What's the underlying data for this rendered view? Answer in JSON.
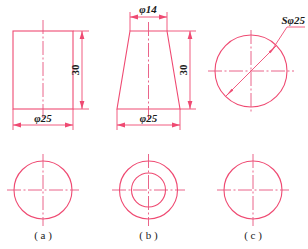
{
  "sheet": {
    "title": "Engineering drawing: three solids with front and top views",
    "background_color": "#ffffff",
    "line_color": "#ef4a72",
    "center_line_color": "#e8537d",
    "text_color": "#1b1b1b"
  },
  "panels": [
    {
      "id": "a",
      "caption": "( a )",
      "shape": "cylinder",
      "front_view": "rectangle",
      "top_view": "single-circle",
      "dimensions": [
        {
          "name": "height",
          "label": "30",
          "orientation": "vertical"
        },
        {
          "name": "diameter",
          "label": "φ25",
          "orientation": "horizontal"
        }
      ]
    },
    {
      "id": "b",
      "caption": "( b )",
      "shape": "truncated-cone",
      "front_view": "trapezoid",
      "top_view": "two-concentric-circles",
      "dimensions": [
        {
          "name": "top-diameter",
          "label": "φ14",
          "orientation": "horizontal"
        },
        {
          "name": "height",
          "label": "30",
          "orientation": "vertical"
        },
        {
          "name": "bottom-diameter",
          "label": "φ25",
          "orientation": "horizontal"
        }
      ]
    },
    {
      "id": "c",
      "caption": "( c )",
      "shape": "sphere",
      "front_view": "circle",
      "top_view": "single-circle",
      "dimensions": [
        {
          "name": "sphere-diameter",
          "label": "Sφ25",
          "orientation": "leader"
        }
      ]
    }
  ],
  "labels": {
    "a_height": "30",
    "a_diameter": "φ25",
    "a_caption": "( a )",
    "b_top_diameter": "φ14",
    "b_height": "30",
    "b_bottom_diameter": "φ25",
    "b_caption": "( b )",
    "c_sphere_diameter": "Sφ25",
    "c_caption": "( c )"
  }
}
